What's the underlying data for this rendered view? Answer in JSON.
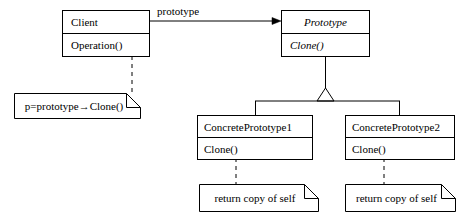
{
  "diagram": {
    "background_color": "#ffffff",
    "line_color": "#000000",
    "classes": [
      {
        "id": "client",
        "name": "Client",
        "operation": "Operation()",
        "abstract": false,
        "x": 62,
        "y": 10,
        "w": 88,
        "h": 47,
        "name_h": 23
      },
      {
        "id": "prototype",
        "name": "Prototype",
        "operation": "Clone()",
        "abstract": true,
        "x": 281,
        "y": 10,
        "w": 89,
        "h": 47,
        "name_h": 23
      },
      {
        "id": "concrete-prototype-1",
        "name": "ConcretePrototype1",
        "operation": "Clone()",
        "abstract": false,
        "x": 197,
        "y": 115,
        "w": 116,
        "h": 45,
        "name_h": 22
      },
      {
        "id": "concrete-prototype-2",
        "name": "ConcretePrototype2",
        "operation": "Clone()",
        "abstract": false,
        "x": 345,
        "y": 115,
        "w": 110,
        "h": 45,
        "name_h": 22
      }
    ],
    "notes": [
      {
        "id": "client-note",
        "text": "p=prototype→Clone()",
        "x": 14,
        "y": 93,
        "w": 126,
        "h": 26,
        "fold": 14
      },
      {
        "id": "concrete-prototype-1-note",
        "text": "return copy of self",
        "x": 199,
        "y": 184,
        "w": 119,
        "h": 27,
        "fold": 14
      },
      {
        "id": "concrete-prototype-2-note",
        "text": "return copy of self",
        "x": 345,
        "y": 184,
        "w": 110,
        "h": 27,
        "fold": 14
      }
    ],
    "association": {
      "label": "prototype",
      "label_x": 157,
      "label_y": 7
    }
  }
}
